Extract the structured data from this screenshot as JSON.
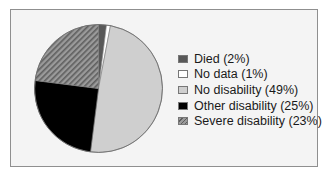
{
  "chart_data": {
    "type": "pie",
    "title": "",
    "categories": [
      "Died",
      "No data",
      "No disability",
      "Other disability",
      "Severe disability"
    ],
    "values": [
      2,
      1,
      49,
      25,
      23
    ],
    "unit": "%",
    "start_angle": "12 o'clock",
    "direction": "clockwise",
    "colors": [
      "#585858",
      "#ffffff",
      "#cfcfcf",
      "#000000",
      "#8a8a8a"
    ],
    "patterns": [
      "solid",
      "solid",
      "solid",
      "solid",
      "diagonal-hatch"
    ],
    "legend_position": "right",
    "legend": [
      {
        "label": "Died (2%)"
      },
      {
        "label": "No data (1%)"
      },
      {
        "label": "No disability (49%)"
      },
      {
        "label": "Other disability (25%)"
      },
      {
        "label": "Severe disability (23%)"
      }
    ]
  }
}
